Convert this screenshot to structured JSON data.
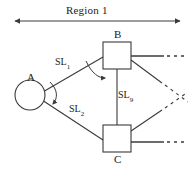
{
  "figure": {
    "type": "node-link-diagram",
    "background_color": "#ffffff",
    "stroke_color": "#3a3a3a",
    "text_color": "#1a1a1a"
  },
  "region": {
    "label": "Region 1",
    "span_arrow": {
      "style": "double-headed",
      "x_start": 14,
      "x_end": 181,
      "y": 21
    }
  },
  "nodes": [
    {
      "id": "A",
      "label": "A",
      "shape": "circle",
      "cx": 30,
      "cy": 95,
      "r": 15,
      "label_position": "above"
    },
    {
      "id": "B",
      "label": "B",
      "shape": "rectangle",
      "x": 103,
      "y": 42,
      "width": 28,
      "height": 27,
      "label_position": "above"
    },
    {
      "id": "C",
      "label": "C",
      "shape": "rectangle",
      "x": 103,
      "y": 125,
      "width": 28,
      "height": 27,
      "label_position": "below"
    }
  ],
  "links": [
    {
      "id": "SL1",
      "label": "SL",
      "subscript": "1",
      "from": "A",
      "to": "B",
      "style": "solid-line"
    },
    {
      "id": "SL2",
      "label": "SL",
      "subscript": "2",
      "from": "A",
      "to": "C",
      "style": "solid-line"
    },
    {
      "id": "SL9",
      "label": "SL",
      "subscript": "9",
      "from": "B",
      "to": "C",
      "style": "solid-line"
    }
  ],
  "curved_arrows": [
    {
      "id": "arrow-a-down",
      "near_node": "A",
      "direction": "down",
      "description": "curved arrow from SL1 link toward SL2 link"
    },
    {
      "id": "arrow-b-right",
      "near_node": "B",
      "direction": "right",
      "description": "curved arrow from B left corner toward SL9 link"
    }
  ],
  "continuation_edges": [
    {
      "from": "B",
      "style": "solid-then-dashed",
      "direction": "right-horizontal"
    },
    {
      "from": "B",
      "style": "solid-then-dashed",
      "direction": "down-right-diagonal"
    },
    {
      "from": "C",
      "style": "solid-then-dashed",
      "direction": "up-right-diagonal"
    },
    {
      "from": "C",
      "style": "solid-then-dashed",
      "direction": "right-horizontal"
    }
  ]
}
